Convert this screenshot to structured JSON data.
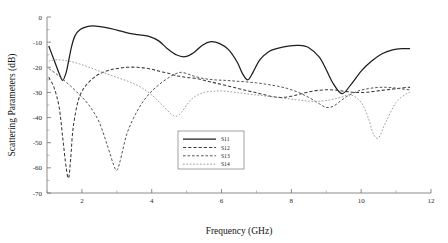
{
  "chart_data": {
    "type": "line",
    "title": "",
    "xlabel": "Frequency (GHz)",
    "ylabel": "Scattering Parameters (dB)",
    "xlim": [
      1,
      12
    ],
    "ylim": [
      -70,
      0
    ],
    "xticks": [
      2,
      4,
      6,
      8,
      10,
      12
    ],
    "yticks": [
      0,
      -10,
      -20,
      -30,
      -40,
      -50,
      -60,
      -70
    ],
    "xtick_labels": [
      "2",
      "4",
      "6",
      "8",
      "10",
      "12"
    ],
    "ytick_labels": [
      "0",
      "-10",
      "-20",
      "-30",
      "-40",
      "-50",
      "-60",
      "-70"
    ],
    "grid": false,
    "legend_position": "lower-center",
    "legend_entries": [
      "S11",
      "S12",
      "S13",
      "S14"
    ],
    "series": [
      {
        "name": "S11",
        "style": "solid",
        "color": "#1e1e1e",
        "x": [
          1.05,
          1.2,
          1.35,
          1.45,
          1.55,
          1.62,
          1.7,
          1.8,
          1.95,
          2.15,
          2.4,
          2.7,
          3.0,
          3.3,
          3.6,
          3.9,
          4.2,
          4.45,
          4.7,
          4.95,
          5.2,
          5.45,
          5.7,
          5.95,
          6.2,
          6.45,
          6.6,
          6.75,
          6.9,
          7.1,
          7.35,
          7.6,
          7.9,
          8.2,
          8.5,
          8.8,
          9.0,
          9.2,
          9.45,
          9.7,
          10.0,
          10.3,
          10.6,
          10.9,
          11.2,
          11.4
        ],
        "y": [
          -11.5,
          -17.0,
          -22.5,
          -25.2,
          -22.0,
          -17.5,
          -12.0,
          -7.5,
          -5.0,
          -3.8,
          -3.6,
          -4.2,
          -5.2,
          -6.3,
          -7.0,
          -7.6,
          -9.5,
          -12.6,
          -15.0,
          -15.8,
          -14.2,
          -11.2,
          -9.8,
          -10.6,
          -13.0,
          -18.0,
          -22.5,
          -25.0,
          -22.0,
          -17.0,
          -13.8,
          -12.5,
          -11.6,
          -11.3,
          -12.2,
          -16.0,
          -21.0,
          -26.5,
          -30.5,
          -27.0,
          -21.5,
          -17.5,
          -14.6,
          -13.1,
          -12.6,
          -12.6
        ]
      },
      {
        "name": "S12",
        "style": "dashed",
        "color": "#3a3a3a",
        "x": [
          1.05,
          1.2,
          1.35,
          1.45,
          1.55,
          1.62,
          1.68,
          1.75,
          1.9,
          2.1,
          2.4,
          2.7,
          3.0,
          3.3,
          3.6,
          3.9,
          4.2,
          4.5,
          4.75,
          5.0,
          5.3,
          5.6,
          5.9,
          6.2,
          6.5,
          6.8,
          7.1,
          7.4,
          7.7,
          8.0,
          8.3,
          8.6,
          8.9,
          9.2,
          9.5,
          9.8,
          10.1,
          10.4,
          10.7,
          11.0,
          11.3,
          11.4
        ],
        "y": [
          -24.0,
          -28.0,
          -36.0,
          -48.0,
          -60.0,
          -64.0,
          -56.0,
          -44.0,
          -33.0,
          -27.5,
          -23.5,
          -21.5,
          -20.5,
          -20.0,
          -20.0,
          -20.5,
          -21.5,
          -22.5,
          -23.5,
          -24.0,
          -24.5,
          -25.5,
          -26.5,
          -27.5,
          -28.5,
          -29.5,
          -30.5,
          -31.5,
          -32.0,
          -31.5,
          -30.5,
          -29.5,
          -29.0,
          -29.0,
          -29.5,
          -30.0,
          -30.0,
          -29.5,
          -29.0,
          -28.5,
          -28.0,
          -28.0
        ]
      },
      {
        "name": "S13",
        "style": "dashed",
        "color": "#555555",
        "x": [
          1.05,
          1.3,
          1.6,
          1.9,
          2.2,
          2.5,
          2.75,
          2.9,
          3.0,
          3.1,
          3.3,
          3.6,
          3.9,
          4.2,
          4.5,
          4.7,
          4.85,
          5.0,
          5.2,
          5.5,
          5.8,
          6.1,
          6.4,
          6.7,
          7.0,
          7.3,
          7.6,
          7.9,
          8.2,
          8.5,
          8.8,
          9.0,
          9.2,
          9.4,
          9.6,
          9.9,
          10.2,
          10.5,
          10.8,
          11.1,
          11.4
        ],
        "y": [
          -20.5,
          -23.0,
          -26.5,
          -30.5,
          -35.0,
          -42.0,
          -52.0,
          -58.5,
          -61.0,
          -57.0,
          -46.0,
          -37.0,
          -31.0,
          -27.0,
          -24.0,
          -22.5,
          -22.0,
          -22.5,
          -23.5,
          -24.5,
          -25.0,
          -25.2,
          -25.5,
          -25.8,
          -26.2,
          -26.8,
          -27.5,
          -28.5,
          -30.0,
          -32.0,
          -34.5,
          -36.0,
          -35.5,
          -33.5,
          -31.5,
          -29.5,
          -28.5,
          -28.0,
          -28.0,
          -28.5,
          -29.0
        ]
      },
      {
        "name": "S14",
        "style": "dotted",
        "color": "#9a9a9a",
        "x": [
          1.05,
          1.3,
          1.6,
          1.9,
          2.2,
          2.5,
          2.8,
          3.1,
          3.4,
          3.7,
          4.0,
          4.3,
          4.55,
          4.7,
          4.85,
          5.0,
          5.2,
          5.5,
          5.8,
          6.1,
          6.4,
          6.7,
          7.0,
          7.3,
          7.6,
          7.9,
          8.2,
          8.5,
          8.8,
          9.1,
          9.4,
          9.7,
          10.0,
          10.2,
          10.35,
          10.5,
          10.7,
          11.0,
          11.3,
          11.4
        ],
        "y": [
          -17.5,
          -17.0,
          -17.5,
          -18.5,
          -20.0,
          -21.5,
          -23.0,
          -24.5,
          -26.0,
          -28.0,
          -31.0,
          -35.0,
          -38.5,
          -39.5,
          -38.0,
          -35.0,
          -32.0,
          -30.0,
          -29.5,
          -29.5,
          -30.0,
          -30.5,
          -31.0,
          -31.5,
          -32.0,
          -32.5,
          -33.0,
          -33.5,
          -33.5,
          -33.0,
          -32.0,
          -31.0,
          -34.0,
          -40.0,
          -46.5,
          -48.0,
          -42.0,
          -34.0,
          -30.5,
          -30.0
        ]
      }
    ]
  }
}
